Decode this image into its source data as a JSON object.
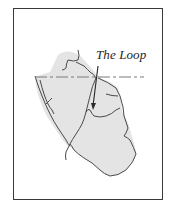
{
  "figure": {
    "annotation_label": "The Loop",
    "colors": {
      "frame": "#3a3a3a",
      "land_fill": "#e4e4e4",
      "river_stroke": "#4a4a4a",
      "boundary_dash": "#7a7a7a",
      "arrow": "#2a2a2a",
      "background": "#ffffff"
    },
    "features": [
      {
        "name": "land-region",
        "type": "shaded-area"
      },
      {
        "name": "dashed-boundary",
        "type": "dashed-line"
      },
      {
        "name": "rivers",
        "type": "lines"
      },
      {
        "name": "loop-arrow",
        "type": "arrow",
        "points_to": "The Loop"
      }
    ]
  }
}
